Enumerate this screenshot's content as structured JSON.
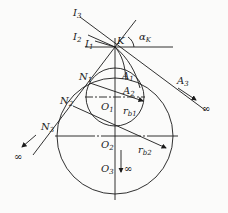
{
  "diagram": {
    "labels": {
      "I3": {
        "main": "I",
        "sub": "3"
      },
      "I2": {
        "main": "I",
        "sub": "2"
      },
      "I1": {
        "main": "I",
        "sub": "1"
      },
      "K": {
        "main": "K",
        "sub": ""
      },
      "alphaK": {
        "main": "α",
        "sub": "K"
      },
      "N1": {
        "main": "N",
        "sub": "1"
      },
      "N2": {
        "main": "N",
        "sub": "2"
      },
      "N3": {
        "main": "N",
        "sub": "3"
      },
      "A1": {
        "main": "A",
        "sub": "1"
      },
      "A2": {
        "main": "A",
        "sub": "2"
      },
      "A3": {
        "main": "A",
        "sub": "3"
      },
      "O1": {
        "main": "O",
        "sub": "1"
      },
      "O2": {
        "main": "O",
        "sub": "2"
      },
      "O3": {
        "main": "O",
        "sub": "3"
      },
      "rb1": {
        "main": "r",
        "sub": "b1"
      },
      "rb2": {
        "main": "r",
        "sub": "b2"
      }
    },
    "infinity_symbol": "∞",
    "line_color": "#1a1a1a",
    "background": "#fbfbfa"
  }
}
